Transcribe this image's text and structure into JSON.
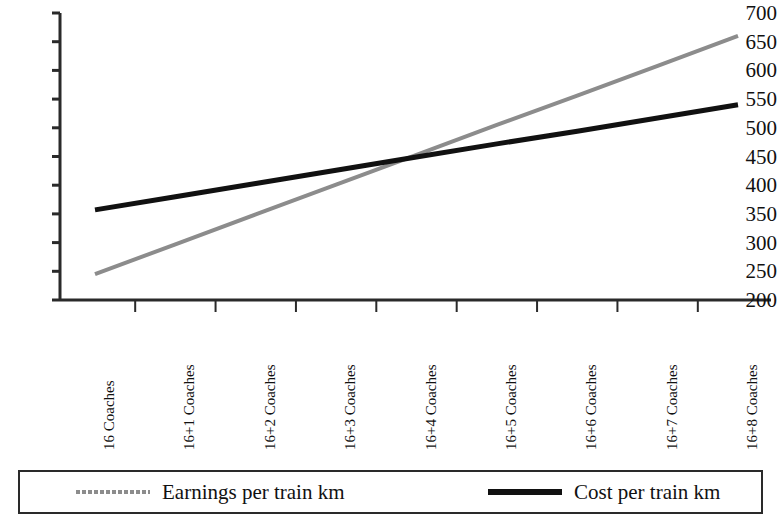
{
  "chart_data": {
    "type": "line",
    "title": "",
    "xlabel": "",
    "ylabel": "",
    "ylim": [
      200,
      700
    ],
    "ytick_step": 50,
    "yticks": [
      700,
      650,
      600,
      550,
      500,
      450,
      400,
      350,
      300,
      250,
      200
    ],
    "grid": false,
    "legend_position": "bottom",
    "categories": [
      "16 Coaches",
      "16+1 Coaches",
      "16+2 Coaches",
      "16+3 Coaches",
      "16+4 Coaches",
      "16+5 Coaches",
      "16+6 Coaches",
      "16+7 Coaches",
      "16+8 Coaches"
    ],
    "series": [
      {
        "name": "Earnings per train km",
        "color": "#8c8c8c",
        "style": "solid-gray",
        "values": [
          245,
          297,
          349,
          401,
          453,
          505,
          556,
          608,
          660
        ]
      },
      {
        "name": "Cost per train km",
        "color": "#111111",
        "style": "solid-black",
        "values": [
          357,
          380,
          403,
          426,
          449,
          472,
          494,
          517,
          540
        ]
      }
    ],
    "annotations": []
  },
  "legend": {
    "items": [
      {
        "label": "Earnings per train km",
        "swatch": "dashed-gray-line"
      },
      {
        "label": "Cost per train km",
        "swatch": "solid-black-line"
      }
    ]
  },
  "colors": {
    "earnings_line": "#8c8c8c",
    "cost_line": "#111111",
    "axis": "#2a2a2a",
    "background": "#ffffff"
  }
}
